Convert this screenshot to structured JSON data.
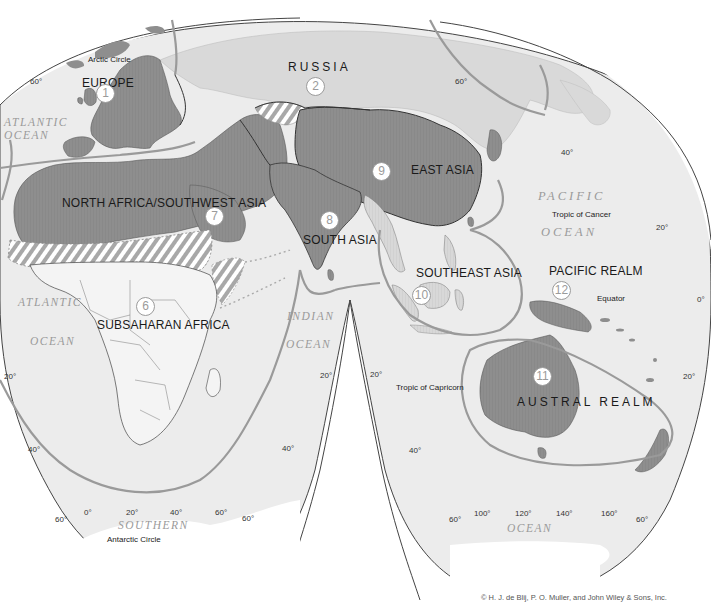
{
  "map": {
    "title": "World Geographic Realms",
    "realms": [
      {
        "number": "1",
        "name": "EUROPE"
      },
      {
        "number": "2",
        "name": "RUSSIA"
      },
      {
        "number": "6",
        "name": "SUBSAHARAN AFRICA"
      },
      {
        "number": "7",
        "name": "NORTH AFRICA/SOUTHWEST ASIA"
      },
      {
        "number": "8",
        "name": "SOUTH ASIA"
      },
      {
        "number": "9",
        "name": "EAST ASIA"
      },
      {
        "number": "10",
        "name": "SOUTHEAST ASIA"
      },
      {
        "number": "11",
        "name": "AUSTRAL REALM"
      },
      {
        "number": "12",
        "name": "PACIFIC REALM"
      }
    ],
    "oceans": {
      "atlantic_n_1": "ATLANTIC",
      "atlantic_n_2": "OCEAN",
      "atlantic_s_1": "ATLANTIC",
      "atlantic_s_2": "OCEAN",
      "indian_1": "INDIAN",
      "indian_2": "OCEAN",
      "pacific_1": "PACIFIC",
      "pacific_2": "OCEAN",
      "southern_1": "SOUTHERN",
      "southern_2": "OCEAN"
    },
    "lines": {
      "arctic_circle": "Arctic Circle",
      "tropic_cancer": "Tropic of Cancer",
      "equator": "Equator",
      "tropic_capricorn": "Tropic of Capricorn",
      "antarctic_circle": "Antarctic Circle"
    },
    "latitude_labels": {
      "nw_60": "60°",
      "w_20": "20°",
      "w_40": "40°",
      "w_60": "60°",
      "mid_l_20": "20°",
      "mid_l_40": "40°",
      "mid_l_60": "60°",
      "mid_r_20": "20°",
      "mid_r_40": "40°",
      "mid_r_60": "60°",
      "ne_60": "60°",
      "e_40": "40°",
      "e_20n": "20°",
      "e_0": "0°",
      "e_20s": "20°",
      "e_60s": "60°"
    },
    "longitude_labels": {
      "lon_0": "0°",
      "lon_20": "20°",
      "lon_40": "40°",
      "lon_60": "60°",
      "lon_100": "100°",
      "lon_120": "120°",
      "lon_140": "140°",
      "lon_160": "160°"
    },
    "colors": {
      "realm_fill": "#8e8e8e",
      "land_light": "#dcdcdc",
      "ocean_fill": "#ececec",
      "boundary_line": "#9a9a9a",
      "border_dark": "#333333",
      "transition_hatch": "#b5b5b5"
    },
    "copyright": "© H. J. de Blij, P. O. Muller, and John Wiley & Sons, Inc."
  }
}
